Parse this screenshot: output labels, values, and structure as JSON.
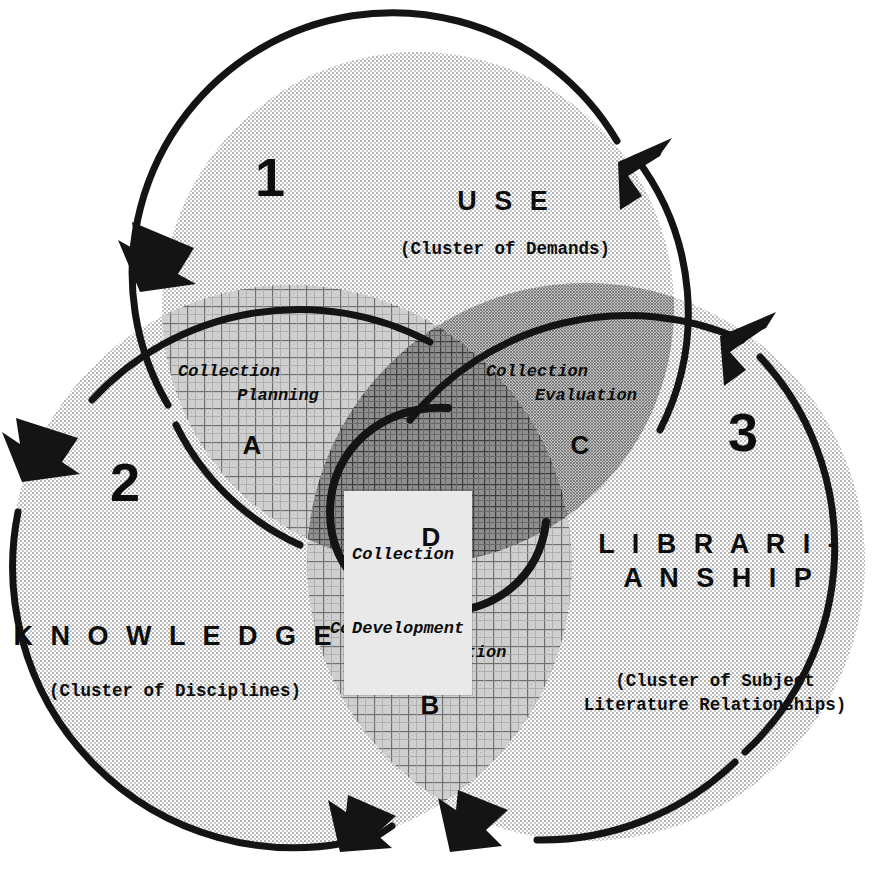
{
  "diagram": {
    "type": "venn-three-circle"
  },
  "circles": [
    {
      "id": "use",
      "numeral": "1",
      "title": "U S E",
      "subtitle": "(Cluster of Demands)",
      "fill": "#d7d7d7"
    },
    {
      "id": "knowledge",
      "numeral": "2",
      "title": "K N O W L E D G E",
      "subtitle": "(Cluster of Disciplines)",
      "fill": "#d7d7d7"
    },
    {
      "id": "librarianship",
      "numeral": "3",
      "title_line1": "L I B R A R I -",
      "title_line2": "A N S H I P",
      "subtitle_line1": "(Cluster of Subject",
      "subtitle_line2": "Literature Relationships)",
      "fill": "#d7d7d7"
    }
  ],
  "regions": [
    {
      "key": "A",
      "letter": "A",
      "label_line1": "Collection",
      "label_line2": "Planning",
      "intersection": "use + knowledge",
      "pattern": "crosshatch-grid"
    },
    {
      "key": "B",
      "letter": "B",
      "label_line1": "Collection",
      "label_line2": "Implementation",
      "intersection": "knowledge + librarianship",
      "pattern": "crosshatch-grid"
    },
    {
      "key": "C",
      "letter": "C",
      "label_line1": "Collection",
      "label_line2": "Evaluation",
      "intersection": "use + librarianship",
      "pattern": "dense-dot"
    },
    {
      "key": "D",
      "letter": "D",
      "label_line1": "Collection",
      "label_line2": "Development",
      "intersection": "use + knowledge + librarianship",
      "pattern": "darkest-crosshatch"
    }
  ],
  "colors": {
    "outline": "#141414",
    "circle_fill": "#d7d7d7",
    "pair_fill": "#b9b9b9",
    "triple_fill": "#9a9a9a",
    "label_box": "#e9e9e9",
    "background": "#ffffff"
  },
  "arrows": {
    "count": 6,
    "meaning": "cyclical flow around the circles",
    "names": [
      "arrow-use-left",
      "arrow-use-right",
      "arrow-knowledge-left",
      "arrow-librarianship-upper",
      "arrow-knowledge-bottom",
      "arrow-librarianship-bottom"
    ]
  }
}
